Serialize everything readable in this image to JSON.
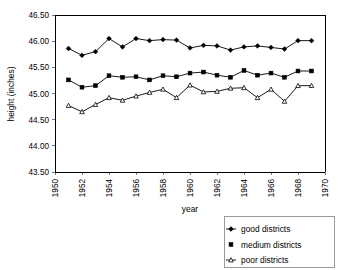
{
  "chart_data": {
    "type": "line",
    "title": "",
    "xlabel": "year",
    "ylabel": "height (inches)",
    "xlim": [
      1950,
      1970
    ],
    "ylim": [
      43.5,
      46.5
    ],
    "ytick_step": 0.5,
    "xtick_step": 2,
    "grid": false,
    "legend_position": "bottom-right-outside",
    "ytick_labels": [
      "43.50",
      "44.00",
      "44.50",
      "45.00",
      "45.50",
      "46.00",
      "46.50"
    ],
    "ytick_values": [
      43.5,
      44.0,
      44.5,
      45.0,
      45.5,
      46.0,
      46.5
    ],
    "xtick_labels": [
      "1950",
      "1952",
      "1954",
      "1956",
      "1958",
      "1960",
      "1962",
      "1964",
      "1966",
      "1968",
      "1970"
    ],
    "xtick_values": [
      1950,
      1952,
      1954,
      1956,
      1958,
      1960,
      1962,
      1964,
      1966,
      1968,
      1970
    ],
    "x": [
      1951,
      1952,
      1953,
      1954,
      1955,
      1956,
      1957,
      1958,
      1959,
      1960,
      1961,
      1962,
      1963,
      1964,
      1965,
      1966,
      1967,
      1968,
      1969
    ],
    "series": [
      {
        "name": "good districts",
        "marker": "diamond-filled",
        "color": "#000000",
        "values": [
          45.86,
          45.73,
          45.8,
          46.05,
          45.89,
          46.05,
          46.01,
          46.03,
          46.02,
          45.87,
          45.92,
          45.91,
          45.83,
          45.89,
          45.91,
          45.88,
          45.85,
          46.01,
          46.01
        ]
      },
      {
        "name": "medium districts",
        "marker": "square-filled",
        "color": "#000000",
        "values": [
          45.26,
          45.12,
          45.15,
          45.34,
          45.31,
          45.32,
          45.26,
          45.34,
          45.32,
          45.39,
          45.41,
          45.35,
          45.31,
          45.44,
          45.35,
          45.39,
          45.31,
          45.43,
          45.43
        ]
      },
      {
        "name": "poor districts",
        "marker": "triangle-open",
        "color": "#000000",
        "values": [
          44.77,
          44.65,
          44.79,
          44.92,
          44.87,
          44.95,
          45.02,
          45.08,
          44.92,
          45.16,
          45.03,
          45.04,
          45.1,
          45.11,
          44.92,
          45.08,
          44.85,
          45.15,
          45.15
        ]
      }
    ]
  },
  "legend": {
    "items": [
      {
        "label": "good districts"
      },
      {
        "label": "medium districts"
      },
      {
        "label": "poor districts"
      }
    ]
  }
}
